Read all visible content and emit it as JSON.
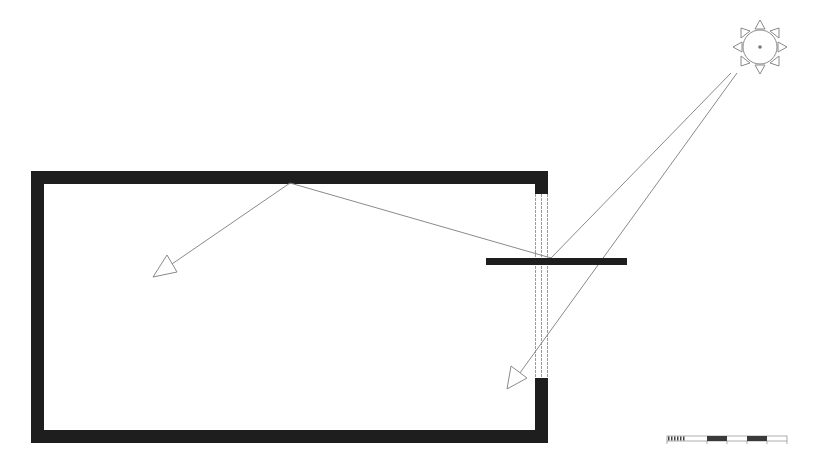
{
  "diagram": {
    "type": "daylighting-light-shelf-section",
    "colors": {
      "background": "#ffffff",
      "wall": "#1e1e1e",
      "ray": "#8a8a8a",
      "window_line": "#9a9a9a",
      "sun_stroke": "#8a8a8a",
      "sun_center": "#777777"
    },
    "room": {
      "outer": {
        "x1": 31,
        "y1": 171,
        "x2": 548,
        "y2": 443
      },
      "wall_thickness": 13,
      "window": {
        "x1": 535,
        "x2": 548,
        "y1": 194,
        "y2": 378
      }
    },
    "light_shelf": {
      "x1": 486,
      "x2": 627,
      "y1": 258,
      "y2": 265
    },
    "sun": {
      "cx": 760,
      "cy": 47,
      "r": 17,
      "rays": 8
    },
    "rays": [
      {
        "name": "direct-ray-to-shelf",
        "points": [
          [
            731,
            73
          ],
          [
            551,
            258
          ]
        ]
      },
      {
        "name": "direct-ray-to-floor",
        "points": [
          [
            737,
            73
          ],
          [
            509,
            388
          ]
        ],
        "arrow": true
      },
      {
        "name": "reflected-ray-to-ceiling",
        "points": [
          [
            551,
            258
          ],
          [
            290,
            183
          ]
        ]
      },
      {
        "name": "reflected-ray-into-room",
        "points": [
          [
            290,
            183
          ],
          [
            153,
            277
          ]
        ],
        "arrow": true
      }
    ],
    "scale_bar": {
      "x": 667,
      "y": 436,
      "width": 120,
      "height": 5,
      "segments": [
        "fine",
        "white",
        "black",
        "white",
        "black",
        "white"
      ]
    }
  }
}
